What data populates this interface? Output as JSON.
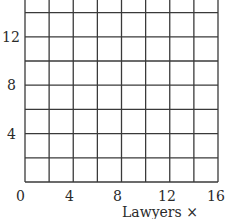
{
  "chart_data": {
    "type": "line",
    "title": "",
    "xlabel": "Lawyers × 1,000",
    "ylabel": "",
    "x_ticks": [
      "0",
      "4",
      "8",
      "12",
      "16"
    ],
    "y_ticks": [
      "4",
      "8",
      "12"
    ],
    "x_origin_label": "0",
    "xlim": [
      0,
      16
    ],
    "ylim": [
      0,
      16
    ],
    "grid": true,
    "grid_step_x": 2,
    "grid_step_y": 2,
    "series": [],
    "note": "Blank grid; no data plotted. Top of grid clipped."
  },
  "colors": {
    "grid": "#3a3a3a",
    "text": "#2a2a2a",
    "background": "#ffffff"
  }
}
